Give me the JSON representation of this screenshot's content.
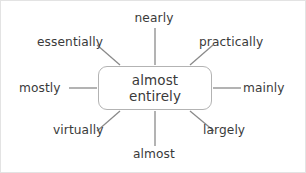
{
  "diagram": {
    "type": "word-web",
    "center": {
      "name": "center-node",
      "line1": "almost",
      "line2": "entirely"
    },
    "nodes": [
      {
        "id": "n",
        "label": "nearly",
        "direction": "north"
      },
      {
        "id": "ne",
        "label": "practically",
        "direction": "north-east"
      },
      {
        "id": "e",
        "label": "mainly",
        "direction": "east"
      },
      {
        "id": "se",
        "label": "largely",
        "direction": "south-east"
      },
      {
        "id": "s",
        "label": "almost",
        "direction": "south"
      },
      {
        "id": "sw",
        "label": "virtually",
        "direction": "south-west"
      },
      {
        "id": "w",
        "label": "mostly",
        "direction": "west"
      },
      {
        "id": "nw",
        "label": "essentially",
        "direction": "north-west"
      }
    ],
    "colors": {
      "text": "#3a3a3a",
      "node_border": "#b3b3b3",
      "connector": "#8a8a8a",
      "background": "#ffffff",
      "canvas_border": "#e3e3e3"
    }
  }
}
